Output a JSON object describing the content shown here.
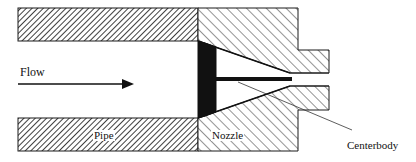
{
  "diagram": {
    "type": "cross-section schematic",
    "labels": {
      "flow": "Flow",
      "pipe": "Pipe",
      "nozzle": "Nozzle",
      "centerbody": "Centerbody"
    },
    "colors": {
      "outline": "#1a1a1a",
      "hatch": "#2a2a2a",
      "centerbody_fill": "#111111",
      "background": "#ffffff"
    },
    "components": [
      {
        "id": "pipe",
        "hatch": "fine 45° (dense)"
      },
      {
        "id": "nozzle",
        "hatch": "coarse 45° (open)",
        "shape": "converging with stepped exit"
      },
      {
        "id": "centerbody",
        "fill": "solid black",
        "shape": "disc with thin rod extending to throat"
      },
      {
        "id": "flow-arrow",
        "direction": "left-to-right"
      }
    ]
  }
}
